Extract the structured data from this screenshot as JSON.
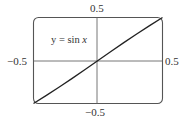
{
  "chart_data": {
    "type": "line",
    "title": "",
    "annotation": "y = sin x",
    "function": "sin",
    "xlabel": "",
    "ylabel": "",
    "xlim": [
      -0.5,
      0.5
    ],
    "ylim": [
      -0.5,
      0.5
    ],
    "x_tick_labels": {
      "left": "−0.5",
      "right": "0.5"
    },
    "y_tick_labels": {
      "top": "0.5",
      "bottom": "−0.5"
    },
    "grid": false,
    "legend": null,
    "series": [
      {
        "name": "y = sin x",
        "x": [
          -0.5,
          -0.4,
          -0.3,
          -0.2,
          -0.1,
          0.0,
          0.1,
          0.2,
          0.3,
          0.4,
          0.5
        ],
        "y": [
          -0.479,
          -0.389,
          -0.296,
          -0.199,
          -0.1,
          0.0,
          0.1,
          0.199,
          0.296,
          0.389,
          0.479
        ]
      }
    ]
  },
  "labels": {
    "equation_prefix": "y = sin ",
    "equation_var": "x",
    "y_top": "0.5",
    "y_bottom": "−0.5",
    "x_left": "−0.5",
    "x_right": "0.5"
  },
  "colors": {
    "axis": "#555555",
    "curve": "#222222",
    "frame": "#444444",
    "text": "#333333"
  }
}
